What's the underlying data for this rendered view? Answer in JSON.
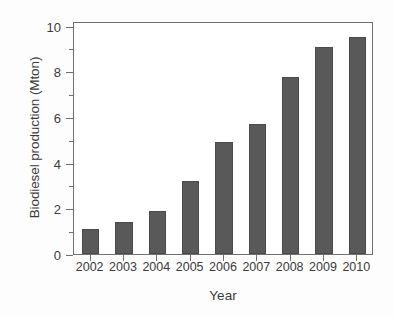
{
  "chart_data": {
    "type": "bar",
    "title": "",
    "xlabel": "Year",
    "ylabel": "Biodiesel production (Mton)",
    "categories": [
      "2002",
      "2003",
      "2004",
      "2005",
      "2006",
      "2007",
      "2008",
      "2009",
      "2010"
    ],
    "values": [
      1.1,
      1.4,
      1.9,
      3.2,
      4.9,
      5.7,
      7.75,
      9.05,
      9.5
    ],
    "series": [
      {
        "name": "Biodiesel production",
        "values": [
          1.1,
          1.4,
          1.9,
          3.2,
          4.9,
          5.7,
          7.75,
          9.05,
          9.5
        ]
      }
    ],
    "ylim": [
      0,
      10.2
    ],
    "ytick_labels": [
      "0",
      "2",
      "4",
      "6",
      "8",
      "10"
    ],
    "ytick_values": [
      0,
      2,
      4,
      6,
      8,
      10
    ],
    "yminor_values": [
      1,
      3,
      5,
      7,
      9
    ],
    "grid": false,
    "legend": false,
    "bar_color": "#595959",
    "axis_color": "#6f6f6f",
    "text_color": "#3b3b3b",
    "background": "#ffffff"
  }
}
